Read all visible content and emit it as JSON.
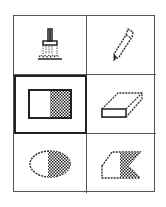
{
  "palette": {
    "name": "Tool palette",
    "selected_tool": "rectangle",
    "colors": {
      "border": "#555555",
      "selected_border": "#222222",
      "ink": "#222222"
    },
    "tools": [
      {
        "id": "paintbrush",
        "label": "Paintbrush",
        "icon": "paintbrush-icon",
        "selected": false
      },
      {
        "id": "pencil",
        "label": "Pencil",
        "icon": "pencil-icon",
        "selected": false
      },
      {
        "id": "rectangle",
        "label": "Filled Rectangle",
        "icon": "filled-rectangle-icon",
        "selected": true
      },
      {
        "id": "eraser",
        "label": "Eraser",
        "icon": "eraser-icon",
        "selected": false
      },
      {
        "id": "oval",
        "label": "Filled Oval",
        "icon": "filled-oval-icon",
        "selected": false
      },
      {
        "id": "polygon",
        "label": "Filled Polygon",
        "icon": "filled-polygon-icon",
        "selected": false
      }
    ]
  }
}
